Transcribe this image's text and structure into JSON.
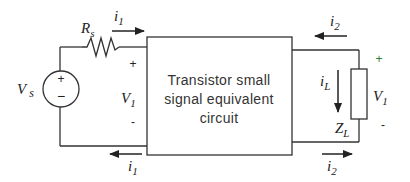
{
  "diagram": {
    "type": "circuit",
    "colors": {
      "wire": "#333333",
      "text": "#222222",
      "box_text": "#333333",
      "plus_right": "#2e7d32"
    },
    "block": {
      "lines": [
        "Transistor small",
        "signal equivalent",
        "circuit"
      ]
    },
    "source": {
      "label": "V",
      "label_sub": "s",
      "plus": "+",
      "minus": "−"
    },
    "resistor": {
      "label": "R",
      "label_sub": "s"
    },
    "input_port": {
      "voltage_label": "V",
      "voltage_sub": "1",
      "plus": "+",
      "minus": "-",
      "current_top": {
        "label": "i",
        "sub": "1",
        "direction": "right"
      },
      "current_bottom": {
        "label": "i",
        "sub": "1",
        "direction": "left"
      }
    },
    "output_port": {
      "current_top": {
        "label": "i",
        "sub": "2",
        "direction": "left"
      },
      "current_bottom": {
        "label": "i",
        "sub": "2",
        "direction": "right"
      }
    },
    "load": {
      "label": "Z",
      "label_sub": "L",
      "current_label": "i",
      "current_sub": "L",
      "current_direction": "down",
      "voltage_label": "V",
      "voltage_sub": "1",
      "plus": "+",
      "minus": "-"
    }
  }
}
